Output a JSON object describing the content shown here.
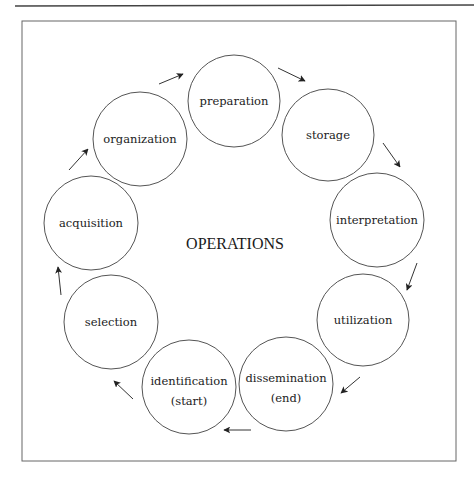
{
  "diagram": {
    "title": "OPERATIONS",
    "colors": {
      "stroke": "#555555",
      "text": "#222222",
      "background": "#ffffff",
      "rule": "#444444",
      "frame": "#666666"
    },
    "top_rule": {
      "x1": 15,
      "y1": 6,
      "x2": 474,
      "y2": 5
    },
    "frame": {
      "x": 22,
      "y": 21,
      "width": 434,
      "height": 440
    },
    "center_label": {
      "text": "OPERATIONS",
      "x": 235,
      "y": 249
    },
    "nodes": [
      {
        "id": "preparation",
        "label": "preparation",
        "sub": "",
        "cx": 234,
        "cy": 101,
        "r": 46
      },
      {
        "id": "storage",
        "label": "storage",
        "sub": "",
        "cx": 328,
        "cy": 135,
        "r": 46
      },
      {
        "id": "interpretation",
        "label": "interpretation",
        "sub": "",
        "cx": 377,
        "cy": 220,
        "r": 47
      },
      {
        "id": "utilization",
        "label": "utilization",
        "sub": "",
        "cx": 363,
        "cy": 320,
        "r": 46
      },
      {
        "id": "dissemination",
        "label": "dissemination",
        "sub": "(end)",
        "cx": 286,
        "cy": 384,
        "r": 47
      },
      {
        "id": "identification",
        "label": "identification",
        "sub": "(start)",
        "cx": 189,
        "cy": 387,
        "r": 47
      },
      {
        "id": "selection",
        "label": "selection",
        "sub": "",
        "cx": 111,
        "cy": 322,
        "r": 47
      },
      {
        "id": "acquisition",
        "label": "acquisition",
        "sub": "",
        "cx": 91,
        "cy": 223,
        "r": 47
      },
      {
        "id": "organization",
        "label": "organization",
        "sub": "",
        "cx": 140,
        "cy": 139,
        "r": 47
      }
    ],
    "arrows": [
      {
        "from": "organization",
        "to": "preparation",
        "x1": 159,
        "y1": 84,
        "x2": 183,
        "y2": 74
      },
      {
        "from": "preparation",
        "to": "storage",
        "x1": 278,
        "y1": 68,
        "x2": 305,
        "y2": 81
      },
      {
        "from": "storage",
        "to": "interpretation",
        "x1": 383,
        "y1": 143,
        "x2": 400,
        "y2": 167
      },
      {
        "from": "interpretation",
        "to": "utilization",
        "x1": 417,
        "y1": 263,
        "x2": 407,
        "y2": 290
      },
      {
        "from": "utilization",
        "to": "dissemination",
        "x1": 360,
        "y1": 377,
        "x2": 341,
        "y2": 393
      },
      {
        "from": "dissemination",
        "to": "identification",
        "x1": 251,
        "y1": 430,
        "x2": 224,
        "y2": 430
      },
      {
        "from": "identification",
        "to": "selection",
        "x1": 133,
        "y1": 399,
        "x2": 114,
        "y2": 381
      },
      {
        "from": "selection",
        "to": "acquisition",
        "x1": 61,
        "y1": 295,
        "x2": 58,
        "y2": 267
      },
      {
        "from": "acquisition",
        "to": "organization",
        "x1": 69,
        "y1": 170,
        "x2": 88,
        "y2": 149
      }
    ]
  }
}
